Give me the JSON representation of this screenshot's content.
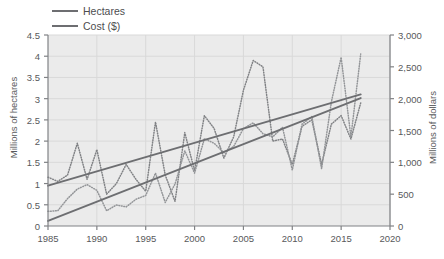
{
  "chart_data": {
    "type": "line",
    "title": "",
    "xlabel": "",
    "ylabel": "Millions of hectares",
    "ylabel_secondary": "Millions of dollars",
    "xlim": [
      1985,
      2020
    ],
    "ylim": [
      0,
      4.5
    ],
    "ylim_secondary": [
      0,
      3000
    ],
    "grid": true,
    "legend_position": "top-left",
    "xticks": [
      "1985",
      "1990",
      "1995",
      "2000",
      "2005",
      "2010",
      "2015",
      "2020"
    ],
    "xtick_values": [
      1985,
      1990,
      1995,
      2000,
      2005,
      2010,
      2015,
      2020
    ],
    "yticks": [
      "0",
      "0.5",
      "1",
      "1.5",
      "2",
      "2.5",
      "3",
      "3.5",
      "4",
      "4.5"
    ],
    "ytick_values": [
      0,
      0.5,
      1,
      1.5,
      2,
      2.5,
      3,
      3.5,
      4,
      4.5
    ],
    "yticks_secondary": [
      "0",
      "500",
      "1,000",
      "1,500",
      "2,000",
      "2,500",
      "3,000"
    ],
    "ytick_values_secondary": [
      0,
      500,
      1000,
      1500,
      2000,
      2500,
      3000
    ],
    "series": [
      {
        "name": "Hectares",
        "axis": "left",
        "color": "#808285",
        "style": "dotted",
        "x": [
          1985,
          1986,
          1987,
          1988,
          1989,
          1990,
          1991,
          1992,
          1993,
          1994,
          1995,
          1996,
          1997,
          1998,
          1999,
          2000,
          2001,
          2002,
          2003,
          2004,
          2005,
          2006,
          2007,
          2008,
          2009,
          2010,
          2011,
          2012,
          2013,
          2014,
          2015,
          2016,
          2017
        ],
        "values": [
          1.15,
          1.05,
          1.2,
          1.95,
          1.1,
          1.8,
          0.75,
          1.0,
          1.45,
          1.1,
          0.82,
          2.45,
          1.2,
          0.58,
          2.2,
          1.3,
          2.6,
          2.3,
          1.6,
          2.1,
          3.2,
          3.9,
          3.75,
          2.0,
          2.05,
          1.45,
          2.35,
          2.5,
          1.45,
          2.4,
          2.6,
          2.05,
          2.9
        ]
      },
      {
        "name": "Cost ($)",
        "axis": "right",
        "color": "#939598",
        "style": "dotted",
        "x": [
          1985,
          1986,
          1987,
          1988,
          1989,
          1990,
          1991,
          1992,
          1993,
          1994,
          1995,
          1996,
          1997,
          1998,
          1999,
          2000,
          2001,
          2002,
          2003,
          2004,
          2005,
          2006,
          2007,
          2008,
          2009,
          2010,
          2011,
          2012,
          2013,
          2014,
          2015,
          2016,
          2017
        ],
        "values": [
          230,
          240,
          430,
          580,
          650,
          560,
          240,
          330,
          300,
          420,
          480,
          830,
          370,
          660,
          1180,
          830,
          1370,
          1300,
          1150,
          1250,
          1530,
          1620,
          1450,
          1400,
          1550,
          880,
          1600,
          1720,
          900,
          1950,
          2650,
          1400,
          2700
        ]
      },
      {
        "name": "Hectares trend",
        "axis": "left",
        "color": "#6d6e71",
        "style": "solid",
        "x": [
          1985,
          2017
        ],
        "values": [
          0.95,
          3.1
        ]
      },
      {
        "name": "Cost trend",
        "axis": "right",
        "color": "#6d6e71",
        "style": "solid",
        "x": [
          1985,
          2017
        ],
        "values": [
          80,
          2010
        ]
      }
    ],
    "legend": [
      {
        "label": "Hectares",
        "color": "#6d6e71"
      },
      {
        "label": "Cost ($)",
        "color": "#6d6e71"
      }
    ],
    "colors": {
      "plot_background": "#ebebeb",
      "grid": "#d9d9d9",
      "axis": "#808285",
      "text": "#58595b"
    }
  }
}
